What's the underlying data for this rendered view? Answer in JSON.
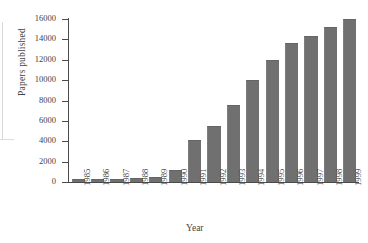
{
  "chart_data": {
    "type": "bar",
    "title": "",
    "xlabel": "Year",
    "ylabel": "Papers published",
    "categories": [
      "1985",
      "1986",
      "1987",
      "1988",
      "1989",
      "1990",
      "1991",
      "1992",
      "1993",
      "1994",
      "1995",
      "1996",
      "1997",
      "1998",
      "1999"
    ],
    "values": [
      200,
      210,
      220,
      300,
      400,
      1100,
      4000,
      5400,
      7450,
      9900,
      11900,
      13500,
      14250,
      15150,
      15950
    ],
    "ylim": [
      0,
      16000
    ],
    "yticks": [
      0,
      2000,
      4000,
      6000,
      8000,
      10000,
      12000,
      14000,
      16000
    ],
    "ytick_labels": [
      "0",
      "2000",
      "4000",
      "6000",
      "8000",
      "10000",
      "12000",
      "14000",
      "16000"
    ],
    "grid": false,
    "legend": "none",
    "bar_color": "#707070",
    "axis_color": "#4a4a4a",
    "text_color": "#3f3f3f",
    "background": "#ffffff"
  }
}
